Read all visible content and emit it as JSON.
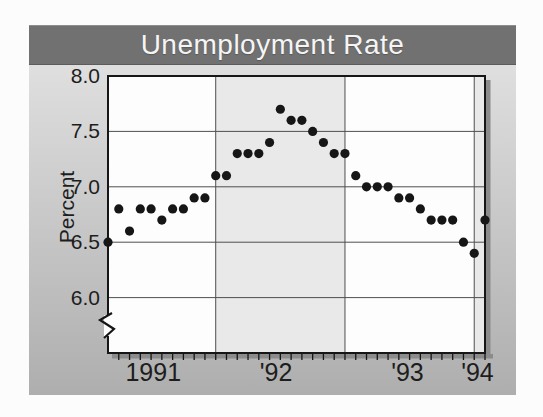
{
  "title": "Unemployment Rate",
  "colors": {
    "page_bg": "#fcfcfc",
    "title_bar": "#717171",
    "title_text": "#f5f5f5",
    "panel_top": "#dfdfdf",
    "panel_bottom": "#aeaeae",
    "band_light": "#fdfdfd",
    "band_shade": "#e9e9e9",
    "axis": "#161616",
    "grid": "#4f4f4f",
    "dot": "#161616",
    "shadow": "#8b8b8b",
    "label": "#1d1d1d"
  },
  "chart_data": {
    "type": "scatter",
    "title": "Unemployment Rate",
    "ylabel": "Percent",
    "x_unit": "month",
    "months": 36,
    "values": [
      6.5,
      6.8,
      6.6,
      6.8,
      6.8,
      6.7,
      6.8,
      6.8,
      6.9,
      6.9,
      7.1,
      7.1,
      7.3,
      7.3,
      7.3,
      7.4,
      7.7,
      7.6,
      7.6,
      7.5,
      7.4,
      7.3,
      7.3,
      7.1,
      7.0,
      7.0,
      7.0,
      6.9,
      6.9,
      6.8,
      6.7,
      6.7,
      6.7,
      6.5,
      6.4,
      6.7
    ],
    "y_ticks": [
      {
        "label": "8.0",
        "value": 8.0
      },
      {
        "label": "7.5",
        "value": 7.5
      },
      {
        "label": "7.0",
        "value": 7.0
      },
      {
        "label": "6.5",
        "value": 6.5
      },
      {
        "label": "6.0",
        "value": 6.0
      }
    ],
    "ylim_top": 8.0,
    "ylim_bottom_visible": 5.5,
    "axis_break": true,
    "grid": true,
    "x_axis_labels": [
      {
        "label": "1991",
        "month": 4.2
      },
      {
        "label": "'92",
        "month": 15.6
      },
      {
        "label": "'93",
        "month": 27.8
      },
      {
        "label": "'94",
        "month": 34.3
      }
    ],
    "year_boundary_months": [
      10,
      22,
      34
    ],
    "shaded_year_spans": [
      [
        10,
        22
      ],
      [
        34,
        35
      ]
    ]
  }
}
